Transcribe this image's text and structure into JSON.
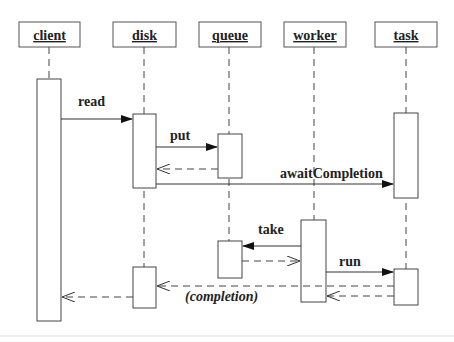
{
  "diagram": {
    "type": "UML sequence diagram",
    "objects": [
      {
        "id": "client",
        "label": "client"
      },
      {
        "id": "disk",
        "label": "disk"
      },
      {
        "id": "queue",
        "label": "queue"
      },
      {
        "id": "worker",
        "label": "worker"
      },
      {
        "id": "task",
        "label": "task"
      }
    ],
    "messages": [
      {
        "from": "client",
        "to": "disk",
        "label": "read",
        "kind": "synchronous"
      },
      {
        "from": "disk",
        "to": "queue",
        "label": "put",
        "kind": "synchronous"
      },
      {
        "from": "queue",
        "to": "disk",
        "label": "",
        "kind": "return"
      },
      {
        "from": "disk",
        "to": "task",
        "label": "awaitCompletion",
        "kind": "synchronous"
      },
      {
        "from": "worker",
        "to": "queue",
        "label": "take",
        "kind": "synchronous"
      },
      {
        "from": "queue",
        "to": "worker",
        "label": "",
        "kind": "return"
      },
      {
        "from": "worker",
        "to": "task",
        "label": "run",
        "kind": "synchronous"
      },
      {
        "from": "task",
        "to": "worker",
        "label": "",
        "kind": "return"
      },
      {
        "from": "task",
        "to": "disk",
        "label": "(completion)",
        "kind": "async-return"
      },
      {
        "from": "disk",
        "to": "client",
        "label": "",
        "kind": "return"
      }
    ]
  }
}
